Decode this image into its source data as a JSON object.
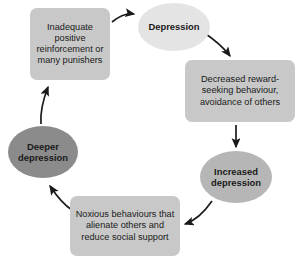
{
  "diagram": {
    "type": "cycle-flowchart",
    "background_color": "#ffffff",
    "arrow_color": "#1a1a1a",
    "nodes": [
      {
        "id": "inadequate",
        "label": "Inadequate positive reinforcement or many punishers",
        "shape": "rounded-rectangle",
        "fill": "#c8c8c8"
      },
      {
        "id": "depression",
        "label": "Depression",
        "shape": "ellipse",
        "fill": "#e4e4e4"
      },
      {
        "id": "decreased",
        "label": "Decreased reward-seeking behaviour, avoidance of others",
        "shape": "rounded-rectangle",
        "fill": "#c8c8c8"
      },
      {
        "id": "increased",
        "label": "Increased depression",
        "shape": "ellipse",
        "fill": "#b6b6b6"
      },
      {
        "id": "noxious",
        "label": "Noxious behaviours that alienate others and reduce social support",
        "shape": "rounded-rectangle",
        "fill": "#c8c8c8"
      },
      {
        "id": "deeper",
        "label": "Deeper depression",
        "shape": "ellipse",
        "fill": "#8b8b8b"
      }
    ],
    "edges": [
      {
        "from": "inadequate",
        "to": "depression"
      },
      {
        "from": "depression",
        "to": "decreased"
      },
      {
        "from": "decreased",
        "to": "increased"
      },
      {
        "from": "increased",
        "to": "noxious"
      },
      {
        "from": "noxious",
        "to": "deeper"
      },
      {
        "from": "deeper",
        "to": "inadequate"
      }
    ]
  }
}
